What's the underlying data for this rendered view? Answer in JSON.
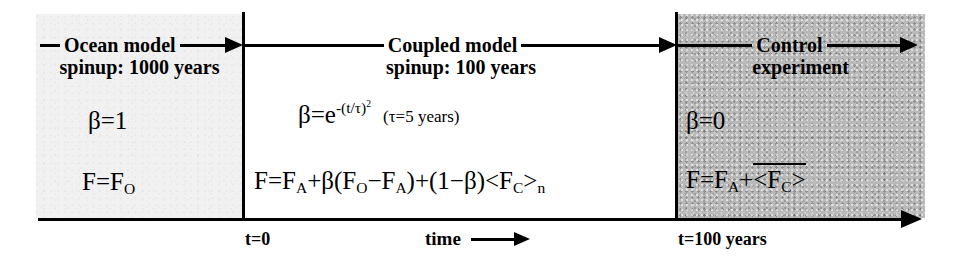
{
  "figure": {
    "name": "model-experiment-timeline",
    "background_color": "#ffffff",
    "line_color": "#000000"
  },
  "phases": [
    {
      "id": "ocean-spinup",
      "header_label": "Ocean model",
      "subheader_label": "spinup: 1000 years",
      "beta_equation": "β=1",
      "flux_equation_prefix": "F=F",
      "flux_equation_sub": "O",
      "shading_color": "#f1f1f1",
      "arrow_direction": "right"
    },
    {
      "id": "coupled-spinup",
      "header_label": "Coupled model",
      "subheader_label": "spinup: 100 years",
      "beta_equation": "β=e",
      "beta_exponent": "-(t/τ)",
      "beta_exponent_power": "2",
      "tau_note": "(τ=5 years)",
      "flux_equation": "F=Fₐ+β(Fₒ−Fₐ)+(1−β)<Fᴄ>ₙ",
      "shading_color": "#ffffff",
      "arrow_direction": "right"
    },
    {
      "id": "control-experiment",
      "header_label": "Control",
      "subheader_label": "experiment",
      "beta_equation": "β=0",
      "flux_equation": "F=Fₐ+<Fᴄ>",
      "flux_has_overbar": true,
      "shading_color": "#b9b9b9",
      "arrow_direction": "right"
    }
  ],
  "equations": {
    "ocean": {
      "beta": "β=1",
      "flux_main": "F=F",
      "flux_sub": "O"
    },
    "coupled": {
      "beta_head": "β=e",
      "beta_exp_base": "-(t/τ)",
      "beta_exp_power": "2",
      "tau_note_open": "(τ=5 years)",
      "flux_p1": "F=F",
      "flux_s1": "A",
      "flux_p2": "+β(F",
      "flux_s2": "O",
      "flux_p3": "−F",
      "flux_s3": "A",
      "flux_p4": ")+(1−β)<F",
      "flux_s4": "C",
      "flux_p5": ">",
      "flux_s5": "n"
    },
    "control": {
      "beta": "β=0",
      "flux_p1": "F=F",
      "flux_s1": "A",
      "flux_p2": "+",
      "flux_overbar_p1": "<F",
      "flux_overbar_s1": "C",
      "flux_overbar_p2": ">"
    }
  },
  "axis": {
    "tick_t0": "t=0",
    "tick_t100": "t=100 years",
    "axis_label": "time",
    "arrow_glyph": "→"
  }
}
